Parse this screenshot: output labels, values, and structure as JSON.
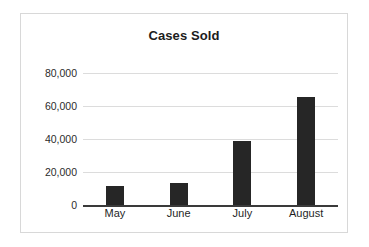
{
  "chart_data": {
    "type": "bar",
    "title": "Cases Sold",
    "xlabel": "",
    "ylabel": "",
    "categories": [
      "May",
      "June",
      "July",
      "August"
    ],
    "values": [
      11500,
      13500,
      38500,
      65500
    ],
    "series": [
      {
        "name": "Cases Sold",
        "values": [
          11500,
          13500,
          38500,
          65500
        ]
      }
    ],
    "ylim": [
      0,
      80000
    ],
    "y_ticks": [
      0,
      20000,
      40000,
      60000,
      80000
    ],
    "y_tick_labels": [
      "0",
      "20,000",
      "40,000",
      "60,000",
      "80,000"
    ],
    "x_tick_labels": [
      "May",
      "June",
      "July",
      "August"
    ],
    "grid": true,
    "legend": false,
    "legend_position": "none",
    "bar_color": "#262626",
    "gridline_color": "#dcdcdc",
    "axis_color": "#3a3a3a",
    "title_color": "#1c1c1c",
    "background_color": "#ffffff",
    "border_color": "#d8d8d8"
  }
}
